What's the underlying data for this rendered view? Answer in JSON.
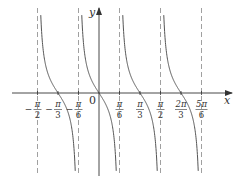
{
  "chart_data": {
    "type": "line",
    "function": "y = -tan(3x)",
    "xlabel": "x",
    "ylabel": "y",
    "origin_label": "0",
    "asymptotes": [
      "-π/2",
      "-π/6",
      "π/6",
      "π/2",
      "5π/6"
    ],
    "zeros": [
      "-π/3",
      "0",
      "π/3",
      "2π/3"
    ],
    "x_ticks": [
      {
        "num": "π",
        "den": "2",
        "sign": "−",
        "value": -1.5708
      },
      {
        "num": "π",
        "den": "3",
        "sign": "−",
        "value": -1.0472
      },
      {
        "num": "π",
        "den": "6",
        "sign": "−",
        "value": -0.5236
      },
      {
        "num": "π",
        "den": "6",
        "sign": "",
        "value": 0.5236
      },
      {
        "num": "π",
        "den": "3",
        "sign": "",
        "value": 1.0472
      },
      {
        "num": "π",
        "den": "2",
        "sign": "",
        "value": 1.5708
      },
      {
        "num": "2π",
        "den": "3",
        "sign": "",
        "value": 2.0944
      },
      {
        "num": "5π",
        "den": "6",
        "sign": "",
        "value": 2.618
      }
    ],
    "grid": false,
    "colors": {
      "curve": "#555555",
      "axis": "#333333",
      "asymptote": "#888888"
    }
  }
}
